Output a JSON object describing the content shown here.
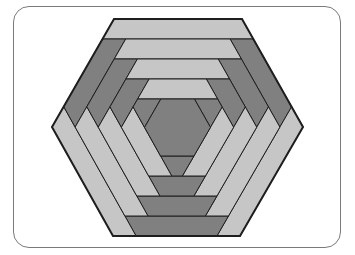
{
  "diagram": {
    "type": "log-cabin-hexagon",
    "center": [
      177.5,
      127.5
    ],
    "outer_vertices": [
      [
        114,
        19
      ],
      [
        242,
        19
      ],
      [
        303,
        127
      ],
      [
        240,
        236
      ],
      [
        113,
        236
      ],
      [
        52,
        127
      ]
    ],
    "rings": 4,
    "ring_scale_step": 0.1843,
    "strip_order": [
      "top",
      "upper-right",
      "lower-right",
      "bottom",
      "lower-left",
      "upper-left"
    ],
    "strip_shades": {
      "top": "light",
      "upper-right": "dark",
      "lower-right": "light",
      "bottom": "dark",
      "lower-left": "light",
      "upper-left": "dark"
    },
    "center_shade": "dark"
  },
  "colors": {
    "light": "#c6c6c6",
    "dark": "#808080",
    "outline": "#1e1e1e",
    "frame": "#7a7a7a",
    "background": "#ffffff"
  }
}
